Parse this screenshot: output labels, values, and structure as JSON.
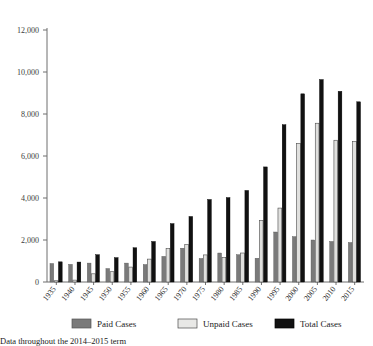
{
  "chart_data": {
    "type": "bar",
    "title": "",
    "subtitle": "",
    "xlabel": "",
    "ylabel": "",
    "ylim": [
      0,
      12000
    ],
    "yticks": [
      0,
      2000,
      4000,
      6000,
      8000,
      10000,
      12000
    ],
    "ytick_labels": [
      "0",
      "2,000",
      "4,000",
      "6,000",
      "8,000",
      "10,000",
      "12,000"
    ],
    "grid": false,
    "legend_position": "bottom",
    "categories": [
      "1935",
      "1940",
      "1945",
      "1950",
      "1955",
      "1960",
      "1965",
      "1970",
      "1975",
      "1980",
      "1985",
      "1990",
      "1995",
      "2000",
      "2005",
      "2010",
      "2015"
    ],
    "series": [
      {
        "name": "Paid Cases",
        "color": "#7a7a7a",
        "values": [
          880,
          840,
          900,
          640,
          900,
          830,
          1220,
          1610,
          1120,
          1380,
          1300,
          1130,
          2380,
          2160,
          2000,
          1930,
          1880
        ]
      },
      {
        "name": "Unpaid Cases",
        "color": "#e0e0de",
        "values": [
          60,
          90,
          390,
          490,
          710,
          1090,
          1590,
          1780,
          1290,
          1160,
          1380,
          2930,
          3520,
          6600,
          7560,
          6750,
          6690
        ]
      },
      {
        "name": "Total Cases",
        "color": "#111111",
        "values": [
          960,
          950,
          1300,
          1160,
          1630,
          1930,
          2780,
          3120,
          3930,
          4020,
          4360,
          5480,
          7490,
          8960,
          9640,
          9080,
          8580
        ]
      }
    ]
  },
  "legend": {
    "items": [
      {
        "label": "Paid Cases",
        "color": "#7a7a7a"
      },
      {
        "label": "Unpaid Cases",
        "color": "#e8e8e6"
      },
      {
        "label": "Total Cases",
        "color": "#111111"
      }
    ]
  },
  "caption": {
    "text": "Data throughout the 2014–2015 term"
  }
}
